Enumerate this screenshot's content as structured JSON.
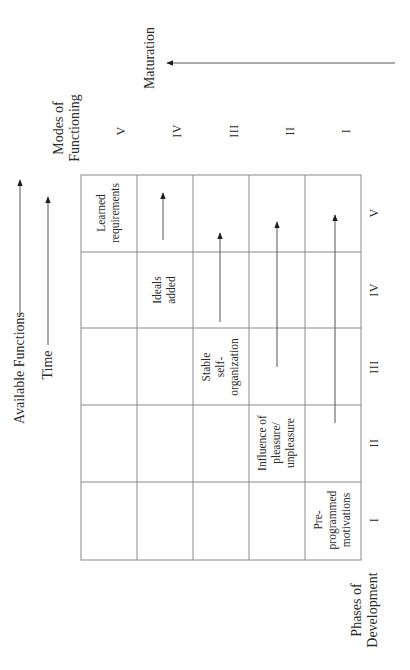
{
  "title_axes": {
    "available_functions": "Available Functions",
    "time": "Time",
    "maturation": "Maturation",
    "modes_of_functioning": "Modes of\nFunctioning",
    "phases_of_development": "Phases of\nDevelopment"
  },
  "modes": [
    "V",
    "IV",
    "III",
    "II",
    "I"
  ],
  "phases": [
    "V",
    "IV",
    "III",
    "II",
    "I"
  ],
  "cells": {
    "learned_requirements": "Learned\nrequirements",
    "ideals_added": "Ideals\nadded",
    "stable_self_organization": "Stable\nself-\norganization",
    "influence_of_pleasure": "Influence of\npleasure/\nunpleasure",
    "preprogrammed_motivations": "Pre-\nprogrammed\nmotivations"
  },
  "colors": {
    "grid": "#8a8a8a",
    "arrow": "#555555",
    "arrowhead": "#1e1e1e",
    "text": "#2a2a2a"
  }
}
